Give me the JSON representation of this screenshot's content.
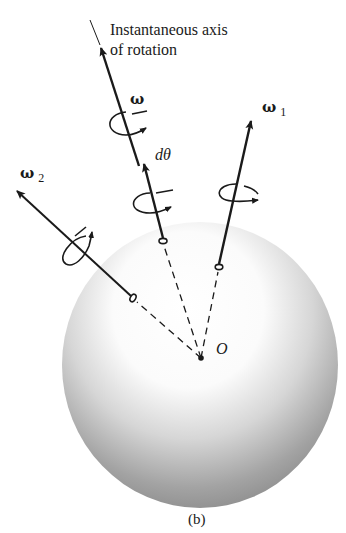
{
  "figure": {
    "caption": "(b)",
    "axis_title_line1": "Instantaneous axis",
    "axis_title_line2": "of rotation",
    "colors": {
      "ink": "#1a1a1a",
      "sphere_highlight": "#ffffff",
      "sphere_shadow": "#8a8a8a",
      "background": "#ffffff"
    }
  },
  "labels": {
    "omega": "ω",
    "omega1": "ω",
    "omega1_sub": "1",
    "omega2": "ω",
    "omega2_sub": "2",
    "dtheta": "dθ",
    "origin": "O"
  },
  "vectors": [
    {
      "name": "omega",
      "from": [
        163,
        240
      ],
      "to": [
        100,
        45
      ],
      "label": "ω"
    },
    {
      "name": "d-theta",
      "from": [
        163,
        240
      ],
      "to": [
        142,
        160
      ],
      "label": "dθ"
    },
    {
      "name": "omega-1",
      "from": [
        219,
        267
      ],
      "to": [
        252,
        118
      ],
      "label": "ω1"
    },
    {
      "name": "omega-2",
      "from": [
        133,
        298
      ],
      "to": [
        14,
        188
      ],
      "label": "ω2"
    }
  ],
  "sphere": {
    "center": [
      200,
      365
    ],
    "rx": 138,
    "ry": 143
  },
  "origin_point": [
    201,
    358
  ]
}
